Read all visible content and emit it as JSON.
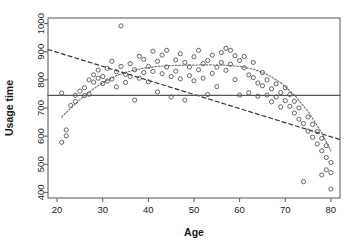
{
  "chart_data": {
    "type": "scatter",
    "title": "",
    "xlabel": "Age",
    "ylabel": "Usage time",
    "xlim": [
      18,
      82
    ],
    "ylim": [
      380,
      1020
    ],
    "xticks": [
      20,
      30,
      40,
      50,
      60,
      70,
      80
    ],
    "yticks": [
      400,
      500,
      600,
      700,
      800,
      900,
      1000
    ],
    "grid": false,
    "legend": "none",
    "marker": "open-circle",
    "marker_color": "#555555",
    "frame_color": "#555555",
    "points": [
      [
        21,
        578
      ],
      [
        22,
        622
      ],
      [
        22,
        601
      ],
      [
        21,
        753
      ],
      [
        23,
        709
      ],
      [
        24,
        723
      ],
      [
        24,
        745
      ],
      [
        25,
        760
      ],
      [
        26,
        744
      ],
      [
        26,
        772
      ],
      [
        27,
        800
      ],
      [
        27,
        749
      ],
      [
        28,
        818
      ],
      [
        28,
        792
      ],
      [
        29,
        806
      ],
      [
        29,
        835
      ],
      [
        30,
        812
      ],
      [
        30,
        787
      ],
      [
        31,
        841
      ],
      [
        31,
        796
      ],
      [
        32,
        866
      ],
      [
        32,
        803
      ],
      [
        33,
        829
      ],
      [
        33,
        775
      ],
      [
        34,
        992
      ],
      [
        34,
        848
      ],
      [
        35,
        820
      ],
      [
        35,
        791
      ],
      [
        36,
        858
      ],
      [
        36,
        812
      ],
      [
        37,
        836
      ],
      [
        37,
        728
      ],
      [
        38,
        884
      ],
      [
        38,
        806
      ],
      [
        39,
        826
      ],
      [
        39,
        873
      ],
      [
        40,
        848
      ],
      [
        40,
        793
      ],
      [
        41,
        902
      ],
      [
        41,
        830
      ],
      [
        42,
        866
      ],
      [
        42,
        757
      ],
      [
        43,
        888
      ],
      [
        43,
        822
      ],
      [
        44,
        905
      ],
      [
        44,
        846
      ],
      [
        45,
        812
      ],
      [
        45,
        739
      ],
      [
        46,
        871
      ],
      [
        46,
        831
      ],
      [
        47,
        893
      ],
      [
        47,
        804
      ],
      [
        48,
        862
      ],
      [
        48,
        728
      ],
      [
        49,
        846
      ],
      [
        49,
        815
      ],
      [
        50,
        882
      ],
      [
        50,
        797
      ],
      [
        51,
        905
      ],
      [
        51,
        836
      ],
      [
        52,
        858
      ],
      [
        52,
        806
      ],
      [
        53,
        869
      ],
      [
        53,
        748
      ],
      [
        54,
        888
      ],
      [
        54,
        823
      ],
      [
        55,
        845
      ],
      [
        55,
        776
      ],
      [
        56,
        897
      ],
      [
        56,
        862
      ],
      [
        57,
        912
      ],
      [
        57,
        834
      ],
      [
        58,
        905
      ],
      [
        58,
        856
      ],
      [
        59,
        886
      ],
      [
        59,
        801
      ],
      [
        60,
        869
      ],
      [
        60,
        746
      ],
      [
        61,
        843
      ],
      [
        61,
        883
      ],
      [
        62,
        818
      ],
      [
        62,
        754
      ],
      [
        63,
        862
      ],
      [
        63,
        808
      ],
      [
        64,
        789
      ],
      [
        64,
        742
      ],
      [
        65,
        826
      ],
      [
        65,
        779
      ],
      [
        66,
        800
      ],
      [
        66,
        746
      ],
      [
        67,
        768
      ],
      [
        67,
        722
      ],
      [
        68,
        786
      ],
      [
        68,
        739
      ],
      [
        69,
        755
      ],
      [
        69,
        704
      ],
      [
        70,
        772
      ],
      [
        70,
        726
      ],
      [
        71,
        706
      ],
      [
        71,
        748
      ],
      [
        72,
        682
      ],
      [
        72,
        724
      ],
      [
        73,
        660
      ],
      [
        73,
        700
      ],
      [
        74,
        645
      ],
      [
        74,
        438
      ],
      [
        75,
        618
      ],
      [
        75,
        668
      ],
      [
        76,
        596
      ],
      [
        76,
        642
      ],
      [
        77,
        572
      ],
      [
        77,
        616
      ],
      [
        78,
        548
      ],
      [
        78,
        592
      ],
      [
        79,
        524
      ],
      [
        79,
        566
      ],
      [
        80,
        506
      ],
      [
        80,
        470
      ],
      [
        80,
        412
      ],
      [
        79,
        480
      ],
      [
        78,
        462
      ]
    ],
    "lines": [
      {
        "name": "linear-fit",
        "style": "dashed",
        "color": "#333333",
        "points": [
          [
            18,
            908
          ],
          [
            82,
            588
          ]
        ]
      },
      {
        "name": "reference-line",
        "style": "solid",
        "color": "#555555",
        "points": [
          [
            18,
            745
          ],
          [
            82,
            745
          ]
        ]
      },
      {
        "name": "smoothing-curve",
        "style": "dotted",
        "color": "#777777",
        "points": [
          [
            21,
            668
          ],
          [
            24,
            715
          ],
          [
            27,
            757
          ],
          [
            30,
            790
          ],
          [
            33,
            815
          ],
          [
            36,
            831
          ],
          [
            39,
            842
          ],
          [
            42,
            848
          ],
          [
            45,
            851
          ],
          [
            48,
            852
          ],
          [
            51,
            853
          ],
          [
            54,
            853
          ],
          [
            57,
            852
          ],
          [
            60,
            848
          ],
          [
            63,
            838
          ],
          [
            66,
            820
          ],
          [
            69,
            790
          ],
          [
            72,
            746
          ],
          [
            75,
            688
          ],
          [
            78,
            612
          ],
          [
            80,
            548
          ]
        ]
      }
    ]
  }
}
